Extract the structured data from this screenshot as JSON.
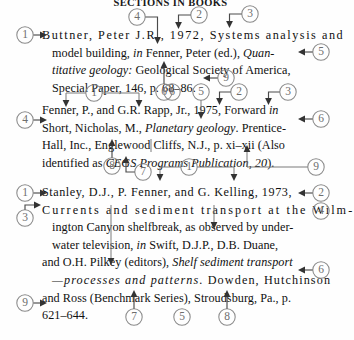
{
  "page": {
    "running_head": "SECTIONS IN BOOKS",
    "width": 341,
    "height": 340,
    "ink_color": "#111111",
    "callout_color": "#6e6e6e",
    "leader_color": "#4a4a4a"
  },
  "references": [
    {
      "id": "ref1",
      "lines": [
        "Buttner, Peter J.R., 1972, Systems analysis and",
        "model building, in Fenner, Peter (ed.), Quan-",
        "titative geology: Geological Society of America,",
        "Special Paper, 146, p. 68–86."
      ],
      "plain_text": "Buttner, Peter J.R., 1972, Systems analysis and model building, in Fenner, Peter (ed.), Quantitative geology: Geological Society of America, Special Paper, 146, p. 68–86."
    },
    {
      "id": "ref2",
      "lines": [
        "Fenner, P., and G.R. Rapp, Jr., 1975, Forward in",
        "Short, Nicholas, M., Planetary geology. Prentice-",
        "Hall, Inc., Englewood Cliffs, N.J., p. xi–xii (Also",
        "identified as CEGS Programs Publication, 20)."
      ],
      "plain_text": "Fenner, P., and G.R. Rapp, Jr., 1975, Forward in Short, Nicholas, M., Planetary geology. Prentice-Hall, Inc., Englewood Cliffs, N.J., p. xi–xii (Also identified as CEGS Programs Publication, 20)."
    },
    {
      "id": "ref3",
      "lines": [
        "Stanley, D.J., P. Fenner, and G. Kelling, 1973,",
        "Currents and sediment transport at the Wilm-",
        "ington Canyon shelfbreak, as observed by under-",
        "water television, in Swift, D.J.P., D.B. Duane,",
        "and O.H. Pilkey (editors), Shelf sediment transport",
        "—processes and patterns. Dowden, Hutchinson",
        "and Ross (Benchmark Series), Stroudsburg, Pa., p.",
        "621–644."
      ],
      "plain_text": "Stanley, D.J., P. Fenner, and G. Kelling, 1973, Currents and sediment transport at the Wilmington Canyon shelfbreak, as observed by underwater television, in Swift, D.J.P., D.B. Duane, and O.H. Pilkey (editors), Shelf sediment transport—processes and patterns. Dowden, Hutchinson and Ross (Benchmark Series), Stroudsburg, Pa., p. 621–644."
    }
  ],
  "callouts": [
    {
      "n": "1",
      "cx": 25,
      "cy": 35,
      "group": "ref1",
      "target": "author-name",
      "style": "right-arrow"
    },
    {
      "n": "4",
      "cx": 137,
      "cy": 17,
      "group": "ref1",
      "target": "initials",
      "style": "down-bracket"
    },
    {
      "n": "2",
      "cx": 199,
      "cy": 15,
      "group": "ref1",
      "target": "year",
      "style": "down-bracket"
    },
    {
      "n": "3",
      "cx": 250,
      "cy": 14,
      "group": "ref1",
      "target": "article-title",
      "style": "down-bracket"
    },
    {
      "n": "5",
      "cx": 321,
      "cy": 52,
      "group": "ref1",
      "target": "book-title",
      "style": "left-arrow"
    },
    {
      "n": "9",
      "cx": 226,
      "cy": 78,
      "group": "ref1",
      "target": "page-numbers",
      "style": "left-arrow"
    },
    {
      "n": "6",
      "cx": 164,
      "cy": 92,
      "group": "ref1",
      "target": "publisher",
      "style": "up-arrow"
    },
    {
      "n": "1",
      "cx": 94,
      "cy": 93,
      "group": "ref2",
      "target": "authors",
      "style": "down-bracket-wide"
    },
    {
      "n": "6",
      "cx": 172,
      "cy": 92,
      "group": "ref2",
      "target": "imprint",
      "style": "up-plain"
    },
    {
      "n": "5",
      "cx": 201,
      "cy": 92,
      "group": "ref2",
      "target": "book-title",
      "style": "down-plain"
    },
    {
      "n": "2",
      "cx": 239,
      "cy": 92,
      "group": "ref2",
      "target": "year",
      "style": "down-bracket"
    },
    {
      "n": "3",
      "cx": 288,
      "cy": 92,
      "group": "ref2",
      "target": "section-title",
      "style": "down-bracket"
    },
    {
      "n": "4",
      "cx": 25,
      "cy": 120,
      "group": "ref2",
      "target": "editor-name",
      "style": "right-arrow"
    },
    {
      "n": "6",
      "cx": 321,
      "cy": 119,
      "group": "ref2",
      "target": "publisher",
      "style": "left-arrow"
    },
    {
      "n": "8",
      "cx": 112,
      "cy": 166,
      "group": "ref2",
      "target": "series-note",
      "style": "up-arrow"
    },
    {
      "n": "7",
      "cx": 143,
      "cy": 172,
      "group": "ref2",
      "target": "pages",
      "style": "up-bracket"
    },
    {
      "n": "1",
      "cx": 189,
      "cy": 167,
      "group": "ref3",
      "target": "authors",
      "style": "down-bracket-wide"
    },
    {
      "n": "9",
      "cx": 316,
      "cy": 167,
      "group": "ref2",
      "target": "report-number",
      "style": "left-plain"
    },
    {
      "n": "1",
      "cx": 25,
      "cy": 193,
      "group": "ref3",
      "target": "first-author",
      "style": "right-arrow"
    },
    {
      "n": "2",
      "cx": 321,
      "cy": 193,
      "group": "ref3",
      "target": "year",
      "style": "left-arrow"
    },
    {
      "n": "3",
      "cx": 25,
      "cy": 218,
      "group": "ref3",
      "target": "article-title",
      "style": "right-arrow-up"
    },
    {
      "n": "4",
      "cx": 321,
      "cy": 211,
      "group": "ref3",
      "target": "article-title-end",
      "style": "left-plain"
    },
    {
      "n": "6",
      "cx": 321,
      "cy": 270,
      "group": "ref3",
      "target": "publisher",
      "style": "left-arrow"
    },
    {
      "n": "9",
      "cx": 25,
      "cy": 303,
      "group": "ref3",
      "target": "page-numbers",
      "style": "right-arrow"
    },
    {
      "n": "7",
      "cx": 134,
      "cy": 317,
      "group": "ref3",
      "target": "series",
      "style": "up-arrow"
    },
    {
      "n": "5",
      "cx": 182,
      "cy": 317,
      "group": "ref3",
      "target": "book-title",
      "style": "up-plain"
    },
    {
      "n": "8",
      "cx": 227,
      "cy": 317,
      "group": "ref3",
      "target": "place",
      "style": "up-arrow"
    }
  ],
  "legend_meaning": {
    "1": "author(s)",
    "2": "year of publication",
    "3": "title of article / section",
    "4": "editor(s) / initials",
    "5": "title of book",
    "6": "publisher",
    "7": "pages",
    "8": "series note",
    "9": "page numbers"
  }
}
